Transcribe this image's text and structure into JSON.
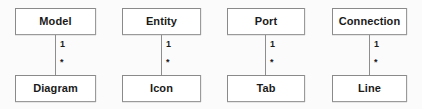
{
  "diagram": {
    "type": "uml-class-diagram",
    "title": "",
    "background_color": "#fbfbfb",
    "box_fill_color": "#ffffff",
    "box_border_color": "#8e8e8e",
    "text_color": "#1a1a1a",
    "connector_color": "#8e8e8e",
    "relationships": [
      {
        "source": "Model",
        "target": "Diagram",
        "source_multiplicity": "1",
        "target_multiplicity": "*",
        "left": 15,
        "width": 81
      },
      {
        "source": "Entity",
        "target": "Icon",
        "source_multiplicity": "1",
        "target_multiplicity": "*",
        "left": 122,
        "width": 79
      },
      {
        "source": "Port",
        "target": "Tab",
        "source_multiplicity": "1",
        "target_multiplicity": "*",
        "left": 227,
        "width": 78
      },
      {
        "source": "Connection",
        "target": "Line",
        "source_multiplicity": "1",
        "target_multiplicity": "*",
        "left": 332,
        "width": 75
      }
    ]
  }
}
